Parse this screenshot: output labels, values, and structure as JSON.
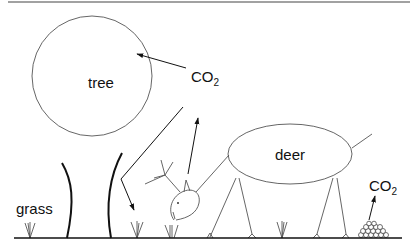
{
  "diagram": {
    "labels": {
      "tree": "tree",
      "deer": "deer",
      "grass": "grass",
      "co2_top_main": "CO",
      "co2_top_sub": "2",
      "co2_right_main": "CO",
      "co2_right_sub": "2"
    },
    "nodes": [
      {
        "id": "tree",
        "label": "tree",
        "shape": "circle"
      },
      {
        "id": "deer",
        "label": "deer",
        "shape": "ellipse"
      },
      {
        "id": "grass",
        "label": "grass",
        "shape": "tufts"
      },
      {
        "id": "co2_air",
        "label": "CO2"
      },
      {
        "id": "co2_dung",
        "label": "CO2"
      },
      {
        "id": "dung",
        "label": "",
        "shape": "pile"
      }
    ],
    "edges": [
      {
        "from": "co2_air",
        "to": "tree"
      },
      {
        "from": "co2_air",
        "to": "grass"
      },
      {
        "from": "deer",
        "to": "co2_air"
      },
      {
        "from": "dung",
        "to": "co2_dung"
      }
    ],
    "colors": {
      "ink": "#111111",
      "thin_line": "#555555",
      "background": "#ffffff"
    }
  }
}
